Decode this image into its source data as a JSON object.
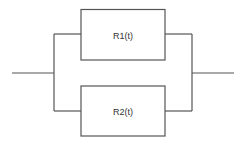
{
  "diagram": {
    "type": "parallel-reliability-block-diagram",
    "line_color": "#555555",
    "blocks": [
      {
        "id": "r1",
        "label": "R1(t)"
      },
      {
        "id": "r2",
        "label": "R2(t)"
      }
    ]
  }
}
